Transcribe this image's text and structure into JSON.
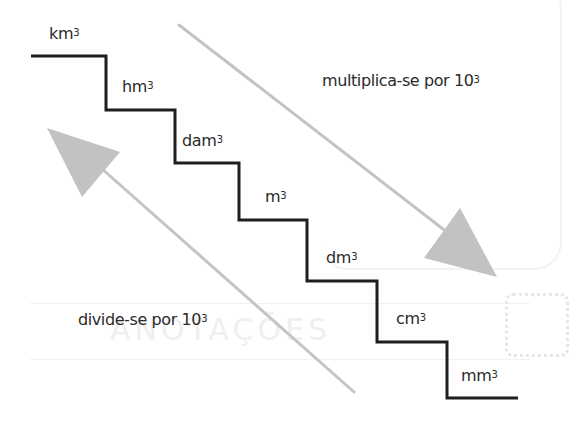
{
  "diagram": {
    "type": "staircase-conversion",
    "colors": {
      "stairs": "#1e1e1e",
      "arrows": "#bdbdbd",
      "text": "#2a2a2a"
    },
    "steps": [
      {
        "unit": "km",
        "exp": "3"
      },
      {
        "unit": "hm",
        "exp": "3"
      },
      {
        "unit": "dam",
        "exp": "3"
      },
      {
        "unit": "m",
        "exp": "3"
      },
      {
        "unit": "dm",
        "exp": "3"
      },
      {
        "unit": "cm",
        "exp": "3"
      },
      {
        "unit": "mm",
        "exp": "3"
      }
    ],
    "down_arrow": {
      "text": "multiplica-se por 10",
      "exp": "3",
      "icon": "arrow-down-right-icon"
    },
    "up_arrow": {
      "text": "divide-se por 10",
      "exp": "3",
      "icon": "arrow-up-left-icon"
    }
  },
  "background_bleed": {
    "faint_title": "ANOTAÇÕES"
  }
}
